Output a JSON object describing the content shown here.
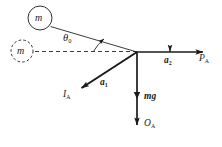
{
  "figure": {
    "type": "physics-free-body-diagram",
    "background_color": "#ffffff",
    "stroke_color": "#1a1a1a",
    "geometry": {
      "pivot": {
        "x": 137,
        "y": 52
      },
      "bob_solid": {
        "cx": 40,
        "cy": 18,
        "r": 12
      },
      "bob_dashed": {
        "cx": 22,
        "cy": 51,
        "r": 11
      },
      "string_end": {
        "x": 50,
        "y": 26
      },
      "dashed_axis_end": {
        "x": 34,
        "y": 51
      },
      "arc_radius": 44
    },
    "elements": {
      "bob_current_label": "m",
      "bob_equilibrium_label": "m",
      "angle_label": "θ",
      "angle_subscript": "0",
      "accel_tangential_label": "a",
      "accel_tangential_subscript": "1",
      "accel_horizontal_label": "a",
      "accel_horizontal_subscript": "2",
      "force_tension_label": "I",
      "force_tension_subscript": "A",
      "force_horizontal_label": "P",
      "force_horizontal_subscript": "A",
      "force_weight_label": "mg",
      "force_vertical_label": "O",
      "force_vertical_subscript": "A"
    },
    "vectors": [
      {
        "name": "horizontal-reaction",
        "from": {
          "x": 137,
          "y": 52
        },
        "to": {
          "x": 205,
          "y": 52
        },
        "label": "P",
        "sub": "A",
        "mid_label": "a",
        "mid_sub": "2"
      },
      {
        "name": "tangential-acceleration",
        "from": {
          "x": 137,
          "y": 52
        },
        "to": {
          "x": 80,
          "y": 89
        },
        "label": "I",
        "sub": "A",
        "mid_label": "a",
        "mid_sub": "1"
      },
      {
        "name": "vertical-reaction",
        "from": {
          "x": 137,
          "y": 52
        },
        "to": {
          "x": 137,
          "y": 127
        },
        "label": "O",
        "sub": "A",
        "mid_label": "mg",
        "mid_sub": ""
      }
    ]
  }
}
